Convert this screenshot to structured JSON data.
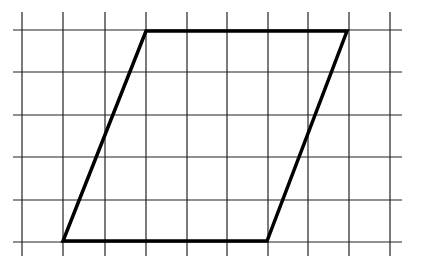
{
  "figure": {
    "grid": {
      "columns_x": [
        22,
        63,
        105,
        146,
        187,
        227,
        268,
        308,
        349,
        390
      ],
      "rows_y": [
        30,
        72,
        115,
        157,
        200,
        242
      ],
      "x_extent": [
        13,
        402
      ],
      "y_extent": [
        12,
        256
      ],
      "line_color": "#222222",
      "cell_size": 41
    },
    "shape": {
      "type": "parallelogram",
      "vertices_grid": [
        [
          3,
          0
        ],
        [
          8,
          0
        ],
        [
          6,
          5
        ],
        [
          1,
          5
        ]
      ],
      "vertices_px": [
        [
          146,
          31
        ],
        [
          347,
          31
        ],
        [
          267,
          241
        ],
        [
          63,
          241
        ]
      ],
      "stroke_color": "#000000",
      "stroke_width": 3.5,
      "top_base_cells": 5,
      "bottom_base_cells": 5,
      "height_cells": 5
    }
  }
}
